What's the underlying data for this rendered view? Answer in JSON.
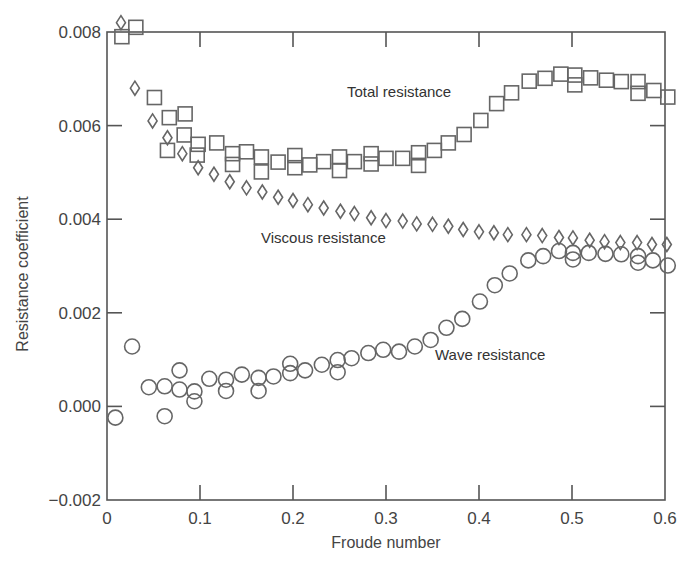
{
  "chart_data": {
    "type": "scatter",
    "title": "",
    "xlabel": "Froude number",
    "ylabel": "Resistance coefficient",
    "xlim": [
      0,
      0.6
    ],
    "ylim": [
      -0.002,
      0.008
    ],
    "grid": false,
    "legend": "none (inline annotations)",
    "x_ticks": [
      "0",
      "0.1",
      "0.2",
      "0.3",
      "0.4",
      "0.5",
      "0.6"
    ],
    "x_tick_values": [
      0,
      0.1,
      0.2,
      0.3,
      0.4,
      0.5,
      0.6
    ],
    "y_ticks": [
      "−0.002",
      "0.000",
      "0.002",
      "0.004",
      "0.006",
      "0.008"
    ],
    "y_tick_values": [
      -0.002,
      0.0,
      0.002,
      0.004,
      0.006,
      0.008
    ],
    "annotations": [
      {
        "text": "Total resistance",
        "x": 0.258,
        "y": 0.00687
      },
      {
        "text": "Viscous resistance",
        "x": 0.166,
        "y": 0.00364
      },
      {
        "text": "Wave resistance",
        "x": 0.352,
        "y": 0.00112
      }
    ],
    "series": [
      {
        "name": "Total resistance",
        "marker": "square",
        "x": [
          0.016,
          0.031,
          0.051,
          0.067,
          0.084,
          0.065,
          0.083,
          0.098,
          0.097,
          0.118,
          0.135,
          0.135,
          0.15,
          0.166,
          0.166,
          0.184,
          0.202,
          0.202,
          0.218,
          0.233,
          0.25,
          0.25,
          0.266,
          0.284,
          0.284,
          0.3,
          0.318,
          0.335,
          0.335,
          0.352,
          0.367,
          0.384,
          0.402,
          0.419,
          0.435,
          0.454,
          0.471,
          0.488,
          0.503,
          0.503,
          0.52,
          0.537,
          0.553,
          0.571,
          0.571,
          0.588,
          0.603
        ],
        "y": [
          0.0079,
          0.0081,
          0.0066,
          0.00617,
          0.00625,
          0.00547,
          0.0058,
          0.0056,
          0.00537,
          0.00563,
          0.0054,
          0.00517,
          0.00544,
          0.00533,
          0.00501,
          0.00522,
          0.00536,
          0.0051,
          0.00516,
          0.00523,
          0.00533,
          0.00504,
          0.00523,
          0.0054,
          0.00518,
          0.0053,
          0.0053,
          0.00542,
          0.00515,
          0.00547,
          0.00563,
          0.00581,
          0.00611,
          0.00647,
          0.0067,
          0.00695,
          0.00701,
          0.0071,
          0.00708,
          0.00687,
          0.00702,
          0.00697,
          0.00694,
          0.00694,
          0.00669,
          0.00675,
          0.00661
        ]
      },
      {
        "name": "Viscous resistance",
        "marker": "diamond",
        "x": [
          0.015,
          0.03,
          0.049,
          0.065,
          0.081,
          0.098,
          0.115,
          0.132,
          0.15,
          0.167,
          0.184,
          0.2,
          0.216,
          0.233,
          0.251,
          0.266,
          0.284,
          0.3,
          0.318,
          0.333,
          0.35,
          0.367,
          0.383,
          0.4,
          0.416,
          0.431,
          0.451,
          0.468,
          0.486,
          0.501,
          0.519,
          0.535,
          0.552,
          0.57,
          0.586,
          0.602
        ],
        "y": [
          0.0082,
          0.0068,
          0.0061,
          0.00574,
          0.0054,
          0.0051,
          0.00496,
          0.0048,
          0.00467,
          0.00458,
          0.00447,
          0.0044,
          0.00431,
          0.00424,
          0.00417,
          0.00412,
          0.00403,
          0.00397,
          0.00396,
          0.0039,
          0.00389,
          0.00385,
          0.00378,
          0.00373,
          0.00371,
          0.00367,
          0.00367,
          0.00365,
          0.00361,
          0.0036,
          0.00355,
          0.00352,
          0.0035,
          0.0035,
          0.00346,
          0.00346
        ]
      },
      {
        "name": "Wave resistance",
        "marker": "circle",
        "x": [
          0.009,
          0.027,
          0.045,
          0.062,
          0.062,
          0.078,
          0.078,
          0.094,
          0.094,
          0.11,
          0.128,
          0.128,
          0.145,
          0.163,
          0.163,
          0.179,
          0.197,
          0.197,
          0.213,
          0.231,
          0.248,
          0.248,
          0.263,
          0.281,
          0.297,
          0.314,
          0.331,
          0.348,
          0.365,
          0.382,
          0.401,
          0.417,
          0.433,
          0.453,
          0.469,
          0.486,
          0.501,
          0.501,
          0.518,
          0.536,
          0.553,
          0.571,
          0.571,
          0.587,
          0.603
        ],
        "y": [
          -0.00024,
          0.00128,
          0.00041,
          0.00043,
          -0.00021,
          0.00077,
          0.00036,
          0.00032,
          0.00011,
          0.00059,
          0.00057,
          0.00033,
          0.00068,
          0.00061,
          0.00033,
          0.00064,
          0.00091,
          0.00071,
          0.00077,
          0.00089,
          0.00099,
          0.00073,
          0.00103,
          0.00114,
          0.00121,
          0.00117,
          0.00128,
          0.00142,
          0.00168,
          0.00187,
          0.00224,
          0.00259,
          0.00284,
          0.00312,
          0.00321,
          0.00332,
          0.00328,
          0.00314,
          0.00328,
          0.00326,
          0.00325,
          0.00321,
          0.00307,
          0.00312,
          0.00301
        ]
      }
    ]
  },
  "labels": {
    "xlabel": "Froude number",
    "ylabel": "Resistance coefficient",
    "annot_total": "Total resistance",
    "annot_viscous": "Viscous resistance",
    "annot_wave": "Wave resistance"
  }
}
